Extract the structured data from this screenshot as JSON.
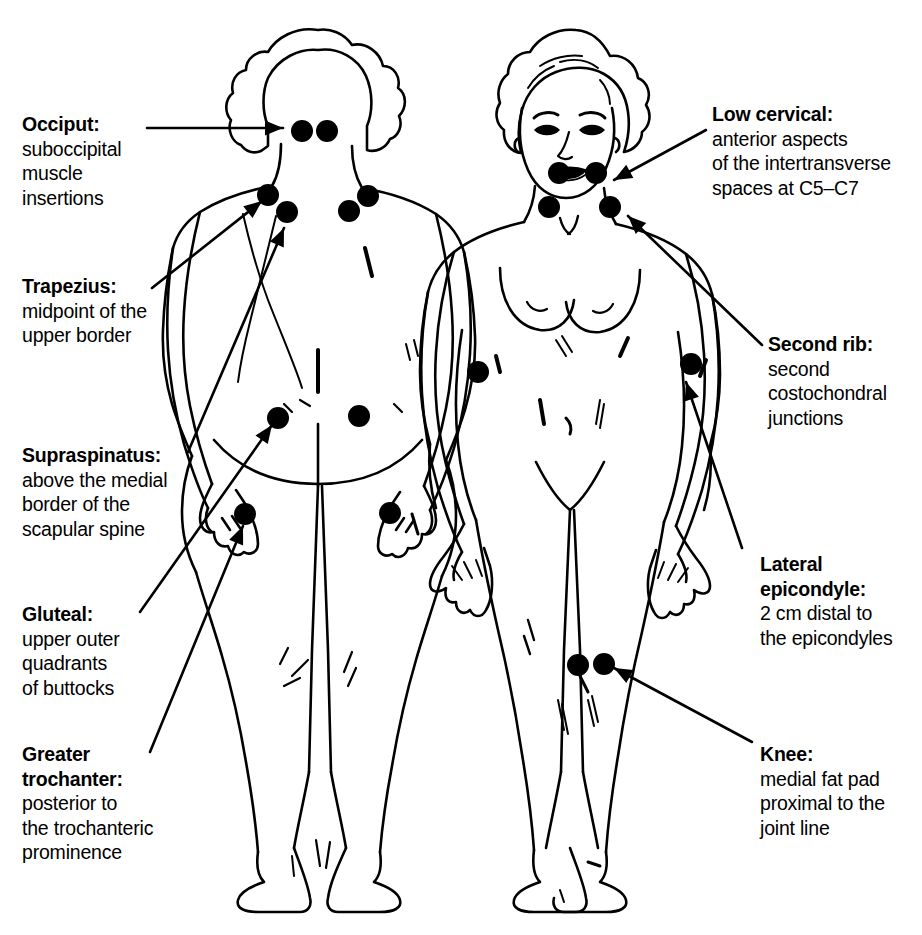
{
  "figure": {
    "views": [
      {
        "name": "posterior-view",
        "description": "posterior (back) view of female figure"
      },
      {
        "name": "anterior-view",
        "description": "anterior (front) view of female figure"
      }
    ],
    "ink_color": "#000000",
    "background_color": "#ffffff",
    "dot_color": "#000000"
  },
  "callouts": [
    {
      "id": "occiput",
      "title": "Occiput:",
      "body": "suboccipital\nmuscle\ninsertions",
      "side": "left",
      "x": 22,
      "y": 112,
      "arrow": {
        "from": [
          147,
          128
        ],
        "to": [
          283,
          128
        ],
        "head": "right"
      }
    },
    {
      "id": "trapezius",
      "title": "Trapezius:",
      "body": "midpoint of the\nupper border",
      "side": "left",
      "x": 22,
      "y": 274,
      "arrow": {
        "from": [
          152,
          288
        ],
        "to": [
          262,
          201
        ],
        "head": "up-right"
      }
    },
    {
      "id": "supraspinatus",
      "title": "Supraspinatus:",
      "body": "above the medial\nborder of the\nscapular spine",
      "side": "left",
      "x": 22,
      "y": 443,
      "arrow": {
        "from": [
          188,
          452
        ],
        "to": [
          284,
          228
        ],
        "head": "up-right"
      }
    },
    {
      "id": "gluteal",
      "title": "Gluteal:",
      "body": "upper outer\nquadrants\nof buttocks",
      "side": "left",
      "x": 22,
      "y": 602,
      "arrow": {
        "from": [
          140,
          612
        ],
        "to": [
          272,
          425
        ],
        "head": "up-right"
      }
    },
    {
      "id": "greater-trochanter",
      "title": "Greater\ntrochanter:",
      "body": "posterior to\nthe trochanteric\nprominence",
      "side": "left",
      "x": 22,
      "y": 742,
      "arrow": {
        "from": [
          150,
          752
        ],
        "to": [
          243,
          526
        ],
        "head": "up-right"
      }
    },
    {
      "id": "low-cervical",
      "title": "Low cervical:",
      "body": "anterior aspects\nof the intertransverse\nspaces at C5–C7",
      "side": "right",
      "x": 712,
      "y": 102,
      "arrow": {
        "from": [
          706,
          130
        ],
        "to": [
          614,
          180
        ],
        "head": "down-left"
      }
    },
    {
      "id": "second-rib",
      "title": "Second rib:",
      "body": "second\ncostochondral\njunctions",
      "side": "right",
      "x": 768,
      "y": 332,
      "arrow": {
        "from": [
          762,
          345
        ],
        "to": [
          628,
          216
        ],
        "head": "up-left"
      }
    },
    {
      "id": "lateral-epicondyle",
      "title": "Lateral\nepicondyle:",
      "body": "2 cm distal to\nthe epicondyles",
      "side": "right",
      "x": 760,
      "y": 552,
      "arrow": {
        "from": [
          742,
          548
        ],
        "to": [
          686,
          382
        ],
        "head": "up-left"
      }
    },
    {
      "id": "knee",
      "title": "Knee:",
      "body": "medial fat pad\nproximal to the\njoint line",
      "side": "right",
      "x": 760,
      "y": 742,
      "arrow": {
        "from": [
          752,
          742
        ],
        "to": [
          614,
          668
        ],
        "head": "up-left"
      }
    }
  ],
  "tender_points": {
    "radius": 11,
    "posterior": [
      {
        "name": "occiput-left",
        "cx": 302,
        "cy": 131
      },
      {
        "name": "occiput-right",
        "cx": 327,
        "cy": 131
      },
      {
        "name": "trapezius-left",
        "cx": 268,
        "cy": 195
      },
      {
        "name": "trapezius-right",
        "cx": 368,
        "cy": 196
      },
      {
        "name": "supraspinatus-left",
        "cx": 287,
        "cy": 212
      },
      {
        "name": "supraspinatus-right",
        "cx": 349,
        "cy": 211
      },
      {
        "name": "gluteal-left",
        "cx": 278,
        "cy": 418
      },
      {
        "name": "gluteal-right",
        "cx": 359,
        "cy": 416
      },
      {
        "name": "greater-trochanter-left",
        "cx": 245,
        "cy": 514
      },
      {
        "name": "greater-trochanter-right",
        "cx": 390,
        "cy": 513
      }
    ],
    "anterior": [
      {
        "name": "low-cervical-left",
        "cx": 559,
        "cy": 173
      },
      {
        "name": "low-cervical-right",
        "cx": 596,
        "cy": 173
      },
      {
        "name": "second-rib-left",
        "cx": 549,
        "cy": 207
      },
      {
        "name": "second-rib-right",
        "cx": 610,
        "cy": 207
      },
      {
        "name": "lateral-epicondyle-left",
        "cx": 478,
        "cy": 372
      },
      {
        "name": "lateral-epicondyle-right",
        "cx": 691,
        "cy": 364
      },
      {
        "name": "knee-left",
        "cx": 578,
        "cy": 665
      },
      {
        "name": "knee-right",
        "cx": 604,
        "cy": 664
      }
    ]
  }
}
